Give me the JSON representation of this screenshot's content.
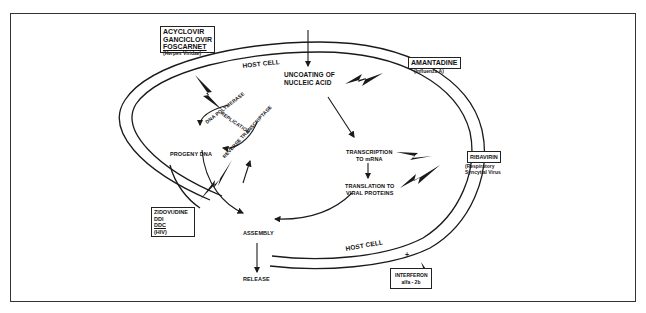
{
  "figure": {
    "membrane_labels": [
      "HOST CELL",
      "HOST CELL"
    ]
  },
  "steps": {
    "uncoating": [
      "UNCOATING OF",
      "NUCLEIC ACID"
    ],
    "dna_polymerase": "DNA POLYMERASE",
    "replication": "REPLICATION",
    "reverse_transcriptase": "REVERSE TRANSCRIPTASE",
    "progeny_dna": "PROGENY DNA",
    "transcription": [
      "TRANSCRIPTION",
      "TO mRNA"
    ],
    "translation": [
      "TRANSLATION TO",
      "VIRAL PROTEINS"
    ],
    "assembly": "ASSEMBLY",
    "release": "RELEASE"
  },
  "drugs": {
    "herpes": {
      "names": [
        "ACYCLOVIR",
        "GANCICLOVIR",
        "FOSCARNET"
      ],
      "target": "(Herpes Viridae)"
    },
    "influenza": {
      "names": [
        "AMANTADINE"
      ],
      "target": "(Influenza A)"
    },
    "rsv": {
      "names": [
        "RIBAVIRIN"
      ],
      "target": [
        "(Respiratory",
        "Syncytial Virus"
      ]
    },
    "hiv": {
      "names": [
        "ZIDOVUDINE",
        "DDI",
        "DDC"
      ],
      "target": "(HIV)"
    },
    "interferon": {
      "names": [
        "INTERFERON",
        "alfa - 2b"
      ],
      "sign": "+"
    }
  },
  "colors": {
    "line": "#1a1a1a",
    "background": "#ffffff"
  }
}
